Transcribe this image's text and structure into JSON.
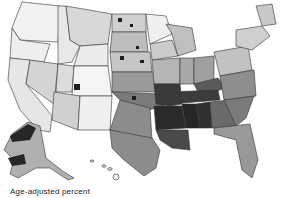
{
  "map": {
    "title": "",
    "type": "choropleth",
    "region": "United States (counties)",
    "shading": "grayscale",
    "legend": {
      "label": "Age-adjusted percent"
    },
    "colors": {
      "lowest": "#ffffff",
      "low": "#d9d9d9",
      "mid": "#a6a6a6",
      "high": "#595959",
      "highest": "#1f1f1f",
      "border": "#333333"
    }
  },
  "caption": "Age-adjusted percent"
}
